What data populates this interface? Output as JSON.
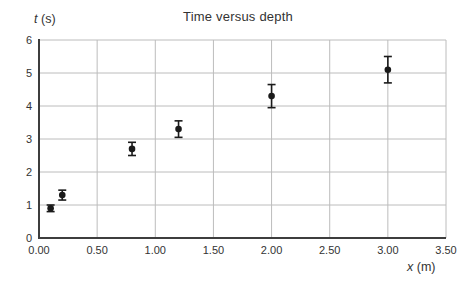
{
  "title": "Time versus depth",
  "axes": {
    "y_var": "t",
    "y_unit": "(s)",
    "x_var": "x",
    "x_unit": "(m)"
  },
  "colors": {
    "background": "#ffffff",
    "grid": "#bcbcbc",
    "axis": "#3d3d3d",
    "marker": "#1a1a1a",
    "text": "#333333"
  },
  "chart_data": {
    "type": "scatter",
    "title": "Time versus depth",
    "xlabel": "x (m)",
    "ylabel": "t (s)",
    "xlim": [
      0,
      3.5
    ],
    "ylim": [
      0,
      6
    ],
    "xticks": [
      0,
      0.5,
      1,
      1.5,
      2,
      2.5,
      3,
      3.5
    ],
    "x_tick_labels": [
      "0.00",
      "0.50",
      "1.00",
      "1.50",
      "2.00",
      "2.50",
      "3.00",
      "3.50"
    ],
    "yticks": [
      0,
      1,
      2,
      3,
      4,
      5,
      6
    ],
    "y_tick_labels": [
      "0",
      "1",
      "2",
      "3",
      "4",
      "5",
      "6"
    ],
    "grid": true,
    "legend": false,
    "marker_style": "filled-black-circle",
    "error_bar_style": "vertical-with-caps",
    "points": [
      {
        "x": 0.1,
        "t": 0.9,
        "t_err": 0.1
      },
      {
        "x": 0.2,
        "t": 1.3,
        "t_err": 0.15
      },
      {
        "x": 0.8,
        "t": 2.7,
        "t_err": 0.2
      },
      {
        "x": 1.2,
        "t": 3.3,
        "t_err": 0.25
      },
      {
        "x": 2.0,
        "t": 4.3,
        "t_err": 0.35
      },
      {
        "x": 3.0,
        "t": 5.1,
        "t_err": 0.4
      }
    ]
  }
}
